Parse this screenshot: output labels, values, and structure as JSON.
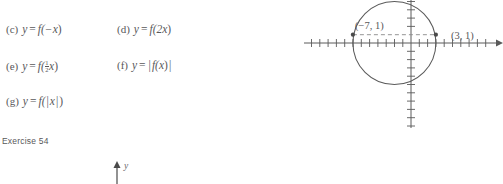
{
  "exercise": {
    "caption": "Exercise 54",
    "parts": [
      {
        "label": "(c)",
        "lhs": "y",
        "eq": "=",
        "expr_prefix": "f(−",
        "expr_var": "x",
        "expr_suffix": ")",
        "kind": "plain",
        "text": "y = f(−x)"
      },
      {
        "label": "(d)",
        "lhs": "y",
        "eq": "=",
        "expr_prefix": "f(2",
        "expr_var": "x",
        "expr_suffix": ")",
        "kind": "plain",
        "text": "y = f(2x)"
      },
      {
        "label": "(e)",
        "lhs": "y",
        "eq": "=",
        "expr_prefix": "f(",
        "expr_var": "x",
        "expr_suffix": ")",
        "kind": "fraction",
        "fraction_num": "1",
        "fraction_den": "2",
        "text": "y = f(½x)"
      },
      {
        "label": "(f)",
        "lhs": "y",
        "eq": "=",
        "expr_prefix": "f(",
        "expr_var": "x",
        "expr_suffix": ")",
        "kind": "abs_outer",
        "text": "y = | f(x) |"
      },
      {
        "label": "(g)",
        "lhs": "y",
        "eq": "=",
        "expr_prefix": "f(",
        "expr_var": "x",
        "expr_suffix": ")",
        "kind": "abs_inner",
        "text": "y = f(|x|)"
      }
    ]
  },
  "figure": {
    "axis_label_x": "x",
    "points": [
      {
        "label": "(−7, 1)",
        "x": -7,
        "y": 1
      },
      {
        "label": "(3, 1)",
        "x": 3,
        "y": 1
      }
    ],
    "circle": {
      "center_x": -2,
      "center_y": 1,
      "radius": 5
    },
    "dashed_chord": true,
    "x_axis_range": [
      -13,
      10
    ],
    "y_axis_range": [
      -10,
      8
    ],
    "tick_spacing": 1,
    "grid": false,
    "stroke_color": "#5a5a5a",
    "dash_color": "#8a8a8a"
  },
  "next_figure": {
    "axis_label": "y"
  }
}
